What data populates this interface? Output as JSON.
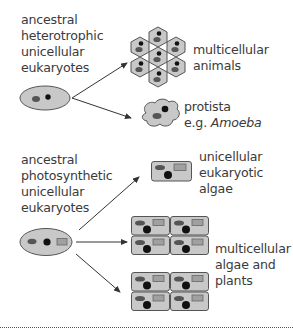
{
  "diagram": {
    "sources": [
      {
        "id": "heterotrophic",
        "label_lines": [
          "ancestral",
          "heterotrophic",
          "unicellular",
          "eukaryotes"
        ]
      },
      {
        "id": "photosynthetic",
        "label_lines": [
          "ancestral",
          "photosynthetic",
          "unicellular",
          "eukaryotes"
        ]
      }
    ],
    "outcomes": [
      {
        "id": "animals",
        "source": "heterotrophic",
        "label_lines": [
          "multicellular",
          "animals"
        ]
      },
      {
        "id": "protista",
        "source": "heterotrophic",
        "label_lines": [
          "protista"
        ],
        "example_prefix": "e.g. ",
        "example_italic": "Amoeba"
      },
      {
        "id": "unicellular-algae",
        "source": "photosynthetic",
        "label_lines": [
          "unicellular",
          "eukaryotic",
          "algae"
        ]
      },
      {
        "id": "multicellular-plants",
        "source": "photosynthetic",
        "label_lines": [
          "multicellular",
          "algae and",
          "plants"
        ]
      }
    ],
    "colors": {
      "cell_fill": "#c8c8c8",
      "cell_stroke": "#666666",
      "nucleus": "#111111",
      "organelle": "#555555",
      "chloroplast": "#a0a0a0",
      "arrow": "#333333"
    }
  }
}
